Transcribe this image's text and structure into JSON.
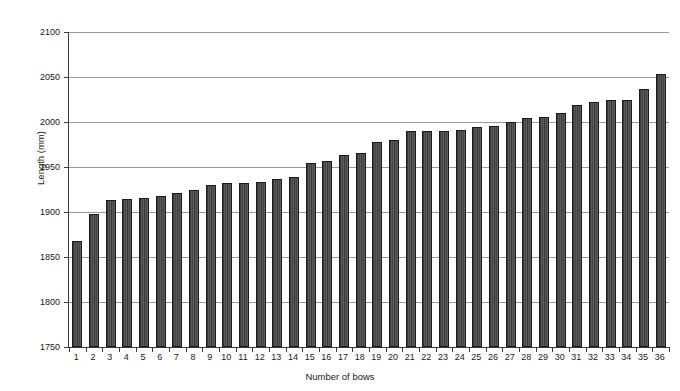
{
  "chart_data": {
    "type": "bar",
    "title": "",
    "xlabel": "Number of bows",
    "ylabel": "Length (mm)",
    "ylim": [
      1750,
      2100
    ],
    "ytick_step": 50,
    "yticks": [
      2100,
      2050,
      2000,
      1950,
      1900,
      1850,
      1800,
      1750
    ],
    "grid": true,
    "legend": "none",
    "bar_color": "#4b4b4b",
    "bar_edge_color": "#1b1b1b",
    "gridline_color": "#9a9a9a",
    "axis_color": "#3a3a3a",
    "categories": [
      "1",
      "2",
      "3",
      "4",
      "5",
      "6",
      "7",
      "8",
      "9",
      "10",
      "11",
      "12",
      "13",
      "14",
      "15",
      "16",
      "17",
      "18",
      "19",
      "20",
      "21",
      "22",
      "23",
      "24",
      "25",
      "26",
      "27",
      "28",
      "29",
      "30",
      "31",
      "32",
      "33",
      "34",
      "35",
      "36"
    ],
    "values": [
      1868,
      1898,
      1913,
      1915,
      1916,
      1918,
      1921,
      1924,
      1930,
      1932,
      1932,
      1933,
      1937,
      1939,
      1955,
      1957,
      1963,
      1966,
      1978,
      1980,
      1990,
      1990,
      1990,
      1991,
      1994,
      1996,
      2000,
      2004,
      2006,
      2010,
      2019,
      2022,
      2024,
      2024,
      2037,
      2053
    ]
  }
}
